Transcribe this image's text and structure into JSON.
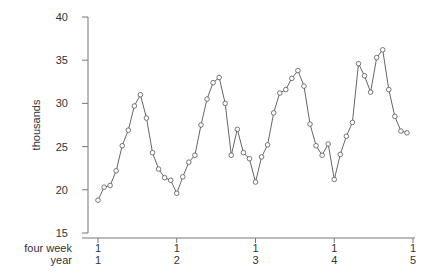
{
  "chart_data": {
    "type": "line",
    "title": "",
    "xlabel": "",
    "ylabel": "thousands",
    "ylim": [
      15,
      40
    ],
    "y_ticks": [
      15,
      20,
      25,
      30,
      35,
      40
    ],
    "grid": false,
    "legend": null,
    "x_axis_rows": [
      {
        "label": "four week",
        "ticks": [
          "1",
          "1",
          "1",
          "1",
          "1"
        ]
      },
      {
        "label": "year",
        "ticks": [
          "1",
          "2",
          "3",
          "4",
          "5"
        ]
      }
    ],
    "periods_per_year": 13,
    "marker": "open-circle",
    "series": [
      {
        "name": "thousands",
        "values": [
          18.8,
          20.3,
          20.5,
          22.2,
          25.1,
          26.9,
          29.7,
          31.0,
          28.3,
          24.3,
          22.4,
          21.4,
          21.1,
          19.6,
          21.5,
          23.2,
          24.0,
          27.5,
          30.5,
          32.4,
          33.0,
          30.0,
          24.0,
          27.0,
          24.3,
          23.6,
          20.9,
          23.8,
          25.2,
          28.9,
          31.2,
          31.6,
          32.9,
          33.8,
          32.0,
          27.6,
          25.1,
          24.0,
          25.3,
          21.2,
          24.1,
          26.2,
          27.8,
          34.6,
          33.2,
          31.3,
          35.3,
          36.2,
          31.6,
          28.5,
          26.8,
          26.6
        ]
      }
    ]
  },
  "colors": {
    "line": "#555555",
    "axis": "#777777",
    "text": "#333333"
  }
}
